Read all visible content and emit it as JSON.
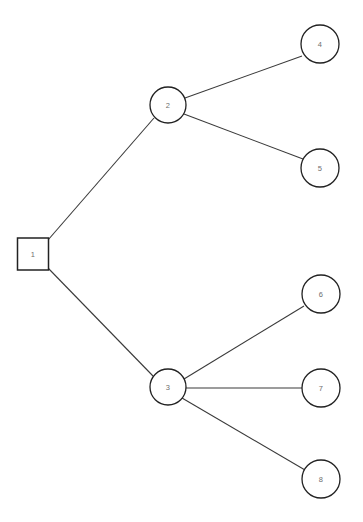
{
  "diagram": {
    "background_color": "#ffffff",
    "edge_color": "#3a3a3a",
    "node_stroke_color": "#222222",
    "node_fill_color": "#ffffff",
    "label_color": "#6e6e6e",
    "canvas": {
      "width": 363,
      "height": 522
    },
    "nodes": [
      {
        "id": "1",
        "label": "1",
        "shape": "square",
        "cx": 33,
        "cy": 254,
        "w": 31,
        "h": 32
      },
      {
        "id": "2",
        "label": "2",
        "shape": "circle",
        "cx": 168,
        "cy": 105,
        "r": 18
      },
      {
        "id": "3",
        "label": "3",
        "shape": "circle",
        "cx": 168,
        "cy": 387,
        "r": 18
      },
      {
        "id": "4",
        "label": "4",
        "shape": "circle",
        "cx": 320,
        "cy": 44,
        "r": 19
      },
      {
        "id": "5",
        "label": "5",
        "shape": "circle",
        "cx": 320,
        "cy": 168,
        "r": 19
      },
      {
        "id": "6",
        "label": "6",
        "shape": "circle",
        "cx": 321,
        "cy": 294,
        "r": 19
      },
      {
        "id": "7",
        "label": "7",
        "shape": "circle",
        "cx": 321,
        "cy": 388,
        "r": 19
      },
      {
        "id": "8",
        "label": "8",
        "shape": "circle",
        "cx": 321,
        "cy": 479,
        "r": 19
      }
    ],
    "edges": [
      {
        "from": "1",
        "to": "2",
        "x1": 48,
        "y1": 240,
        "x2": 154,
        "y2": 118
      },
      {
        "from": "1",
        "to": "3",
        "x1": 48,
        "y1": 268,
        "x2": 153,
        "y2": 376
      },
      {
        "from": "2",
        "to": "4",
        "x1": 185,
        "y1": 98,
        "x2": 302,
        "y2": 56
      },
      {
        "from": "2",
        "to": "5",
        "x1": 184,
        "y1": 114,
        "x2": 303,
        "y2": 159
      },
      {
        "from": "3",
        "to": "6",
        "x1": 184,
        "y1": 379,
        "x2": 304,
        "y2": 306
      },
      {
        "from": "3",
        "to": "7",
        "x1": 186,
        "y1": 388,
        "x2": 302,
        "y2": 388
      },
      {
        "from": "3",
        "to": "8",
        "x1": 182,
        "y1": 398,
        "x2": 305,
        "y2": 470
      }
    ]
  }
}
